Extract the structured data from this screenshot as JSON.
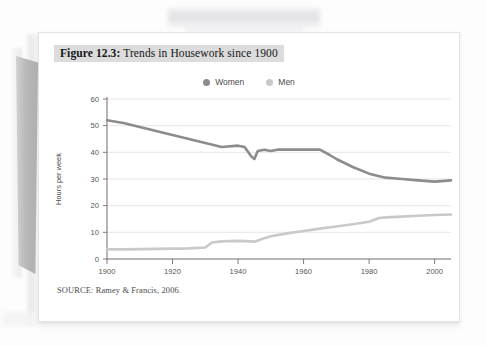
{
  "figure": {
    "caption_number": "Figure 12.3:",
    "caption_text": " Trends in Housework since 1900",
    "source_note": "SOURCE: Ramey & Francis, 2006."
  },
  "colors": {
    "women_line": "#8c8c8c",
    "men_line": "#c9c9c9",
    "grid": "#e0e0e0",
    "axis": "#6e6e6e",
    "caption_highlight": "#dcdcdc",
    "card_background": "#ffffff"
  },
  "chart_data": {
    "type": "line",
    "title": "Trends in Housework since 1900",
    "xlabel": "",
    "ylabel": "Hours per week",
    "xlim": [
      1900,
      2005
    ],
    "ylim": [
      0,
      60
    ],
    "xticks": [
      1900,
      1920,
      1940,
      1960,
      1980,
      2000
    ],
    "yticks": [
      0,
      10,
      20,
      30,
      40,
      50,
      60
    ],
    "grid": "horizontal",
    "legend_position": "top-center",
    "series": [
      {
        "name": "Women",
        "color": "#8c8c8c",
        "x": [
          1900,
          1905,
          1910,
          1915,
          1920,
          1925,
          1930,
          1935,
          1940,
          1942,
          1944,
          1945,
          1946,
          1948,
          1950,
          1952,
          1954,
          1956,
          1958,
          1960,
          1962,
          1965,
          1968,
          1970,
          1975,
          1980,
          1985,
          1990,
          1995,
          2000,
          2005
        ],
        "y": [
          52.0,
          51.0,
          49.5,
          48.0,
          46.5,
          45.0,
          43.5,
          42.0,
          42.5,
          42.0,
          38.5,
          37.5,
          40.5,
          41.0,
          40.5,
          41.0,
          41.0,
          41.0,
          41.0,
          41.0,
          41.0,
          41.0,
          39.0,
          37.5,
          34.5,
          32.0,
          30.5,
          30.0,
          29.5,
          29.0,
          29.5
        ]
      },
      {
        "name": "Men",
        "color": "#c9c9c9",
        "x": [
          1900,
          1905,
          1910,
          1915,
          1920,
          1925,
          1930,
          1932,
          1935,
          1940,
          1945,
          1948,
          1950,
          1955,
          1960,
          1965,
          1970,
          1975,
          1980,
          1983,
          1985,
          1990,
          1995,
          2000,
          2005
        ],
        "y": [
          3.6,
          3.6,
          3.7,
          3.8,
          3.9,
          4.0,
          4.3,
          6.2,
          6.6,
          6.8,
          6.5,
          7.8,
          8.5,
          9.6,
          10.5,
          11.4,
          12.2,
          13.0,
          14.0,
          15.4,
          15.6,
          15.9,
          16.2,
          16.5,
          16.7
        ]
      }
    ]
  },
  "legend": {
    "items": [
      {
        "label": "Women",
        "color": "#8c8c8c"
      },
      {
        "label": "Men",
        "color": "#c9c9c9"
      }
    ]
  },
  "axis": {
    "y_title": "Hours per week",
    "y_ticks": [
      "0",
      "10",
      "20",
      "30",
      "40",
      "50",
      "60"
    ],
    "x_ticks": [
      "1900",
      "1920",
      "1940",
      "1960",
      "1980",
      "2000"
    ]
  }
}
